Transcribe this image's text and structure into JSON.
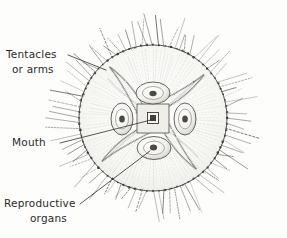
{
  "figure": {
    "style": "hand-drawn pencil illustration on off-white paper",
    "background_color": "#fdfdfb",
    "ink_color": "#3a3a3a",
    "labels": [
      {
        "id": "tentacles",
        "line1": "Tentacles",
        "line2": "or arms",
        "text_x": 6,
        "text_y": 58,
        "leader": {
          "x1": 68,
          "y1": 55,
          "x2": 106,
          "y2": 70
        }
      },
      {
        "id": "mouth",
        "line1": "Mouth",
        "line2": "",
        "text_x": 12,
        "text_y": 146,
        "leader": {
          "x1": 60,
          "y1": 143,
          "x2": 151,
          "y2": 120
        }
      },
      {
        "id": "reproductive",
        "line1": "Reproductive",
        "line2": "organs",
        "text_x": 6,
        "text_y": 207,
        "leader": {
          "x1": 80,
          "y1": 204,
          "x2": 150,
          "y2": 151
        }
      }
    ],
    "body": {
      "center_x": 153,
      "center_y": 118,
      "disc_radius_x": 74,
      "disc_radius_y": 73,
      "rim_bead_count": 76,
      "tentacle_count": 84,
      "tentacle_length_min": 14,
      "tentacle_length_max": 34,
      "radial_canal_count": 112,
      "arm_count": 4,
      "arm_rotation_deg": 45,
      "arm_length": 68,
      "organ_count": 4,
      "organ_radius": 13,
      "mouth_square_size": 11
    }
  }
}
